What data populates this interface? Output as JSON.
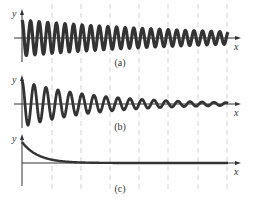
{
  "figure": {
    "panels": [
      {
        "id": "a",
        "caption": "(a)",
        "x_label": "x",
        "y_label": "y",
        "description": "Lightly damped oscillation: many cycles, slow amplitude decay",
        "axis_y": 38,
        "caption_y": 66,
        "curve": {
          "type": "damped-sine",
          "x0": 22,
          "x1": 228,
          "amp0": 18,
          "decay": 0.0052,
          "period": 8.6,
          "stroke_width": 3.2
        }
      },
      {
        "id": "b",
        "caption": "(b)",
        "x_label": "x",
        "y_label": "y",
        "description": "Moderately damped oscillation: amplitude decays more quickly",
        "axis_y": 104,
        "caption_y": 130,
        "curve": {
          "type": "damped-sine",
          "x0": 22,
          "x1": 228,
          "amp0": 23,
          "decay": 0.0135,
          "period": 12.0,
          "stroke_width": 2.8
        }
      },
      {
        "id": "c",
        "caption": "(c)",
        "x_label": "x",
        "y_label": "y",
        "description": "Overdamped: exponential decay to zero with no oscillation",
        "axis_y": 163,
        "caption_y": 191,
        "curve": {
          "type": "exp-decay",
          "x0": 22,
          "x1": 228,
          "amp0": 21,
          "decay": 0.062,
          "stroke_width": 2.4
        }
      }
    ],
    "gridlines_x": [
      52,
      81,
      110,
      139,
      168,
      198,
      227
    ],
    "colors": {
      "curve": "#333333",
      "axis": "#333333",
      "grid": "#c8c8c8"
    }
  }
}
